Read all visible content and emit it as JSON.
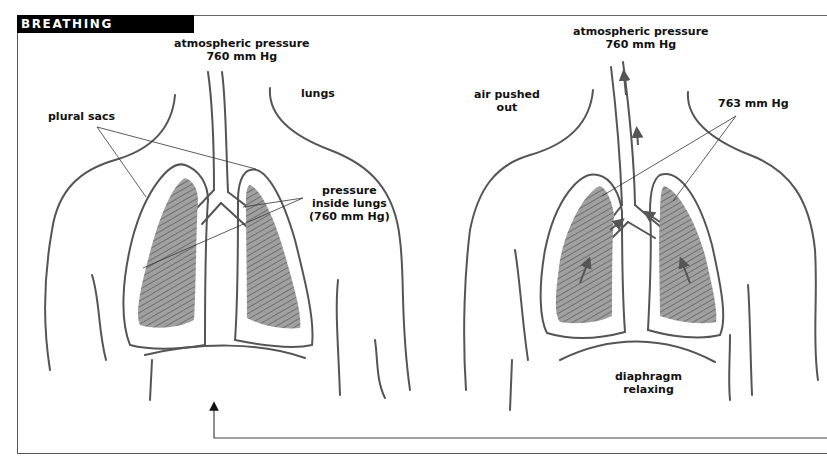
{
  "title": "BREATHING MECHANICS",
  "left_panel": {
    "atmospheric_label": "atmospheric pressure",
    "atmospheric_value": "760 mm Hg",
    "lungs_label": "lungs",
    "plural_sacs_label": "plural sacs",
    "pressure_line1": "pressure",
    "pressure_line2": "inside lungs",
    "pressure_line3": "(760 mm Hg)"
  },
  "right_panel": {
    "atmospheric_label": "atmospheric pressure",
    "atmospheric_value": "760 mm Hg",
    "air_line1": "air pushed",
    "air_line2": "out",
    "lung_pressure": "763 mm Hg",
    "diaphragm_line1": "diaphragm",
    "diaphragm_line2": "relaxing"
  },
  "colors": {
    "banner_bg": "#000000",
    "banner_text": "#ffffff",
    "outline": "#555555",
    "lung_fill": "#9a9a9a",
    "hatch": "#333333"
  }
}
